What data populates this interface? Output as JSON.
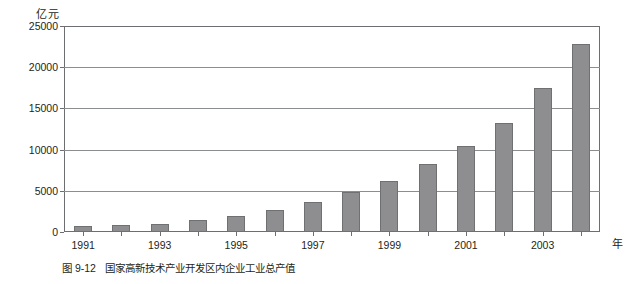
{
  "chart_data": {
    "type": "bar",
    "title": "",
    "unit_label": "亿元",
    "xlabel": "年",
    "ylabel": "",
    "ylim": [
      0,
      25000
    ],
    "yticks": [
      0,
      5000,
      10000,
      15000,
      20000,
      25000
    ],
    "ytick_labels": [
      "0",
      "5000",
      "10000",
      "15000",
      "20000",
      "25000"
    ],
    "grid": true,
    "legend": "none",
    "categories": [
      1991,
      1992,
      1993,
      1994,
      1995,
      1996,
      1997,
      1998,
      1999,
      2000,
      2001,
      2002,
      2003,
      2004
    ],
    "xtick_labels": [
      "1991",
      "",
      "1993",
      "",
      "1995",
      "",
      "1997",
      "",
      "1999",
      "",
      "2001",
      "",
      "2003",
      ""
    ],
    "values": [
      700,
      800,
      1000,
      1400,
      2000,
      2700,
      3600,
      4800,
      6200,
      8300,
      10400,
      13200,
      17500,
      22800
    ],
    "bar_color": "#8e8e90",
    "bar_edge_color": "#6f7072",
    "axis_color": "#6d6e71"
  },
  "caption": {
    "number": "图 9-12",
    "text": "国家高新技术产业开发区内企业工业总产值"
  }
}
